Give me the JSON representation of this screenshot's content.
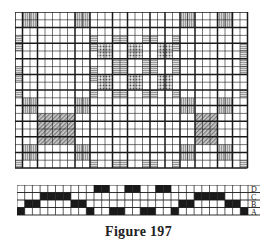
{
  "figure": {
    "caption": "Figure 197",
    "ink_color": "#1a1a1a",
    "shade_color": "#9a9a9a",
    "dot_color": "#555555"
  },
  "main_grid": {
    "cols": 31,
    "rows": 20,
    "cell_w": 7.5,
    "cell_h": 7.8,
    "thick_cols": [
      0,
      1,
      3,
      8,
      10,
      13,
      15,
      18,
      20,
      22,
      24,
      27,
      29,
      31
    ],
    "thick_rows": [
      0,
      2,
      4,
      6,
      8,
      10,
      12,
      14,
      16,
      18,
      20
    ],
    "shaded_blocks": [
      {
        "c": 1,
        "r": 0,
        "w": 2,
        "h": 2,
        "style": "vertical"
      },
      {
        "c": 8,
        "r": 0,
        "w": 2,
        "h": 2,
        "style": "vertical"
      },
      {
        "c": 22,
        "r": 0,
        "w": 2,
        "h": 2,
        "style": "vertical"
      },
      {
        "c": 27,
        "r": 0,
        "w": 2,
        "h": 2,
        "style": "vertical"
      },
      {
        "c": 0,
        "r": 3,
        "w": 1,
        "h": 2,
        "style": "horizontal"
      },
      {
        "c": 10,
        "r": 3,
        "w": 1,
        "h": 2,
        "style": "horizontal"
      },
      {
        "c": 13,
        "r": 3,
        "w": 2,
        "h": 1,
        "style": "horizontal"
      },
      {
        "c": 17,
        "r": 3,
        "w": 2,
        "h": 1,
        "style": "horizontal"
      },
      {
        "c": 21,
        "r": 3,
        "w": 1,
        "h": 2,
        "style": "horizontal"
      },
      {
        "c": 30,
        "r": 4,
        "w": 1,
        "h": 2,
        "style": "horizontal"
      },
      {
        "c": 11,
        "r": 4,
        "w": 2,
        "h": 2,
        "style": "dots"
      },
      {
        "c": 15,
        "r": 4,
        "w": 2,
        "h": 2,
        "style": "dots"
      },
      {
        "c": 19,
        "r": 4,
        "w": 2,
        "h": 2,
        "style": "dots"
      },
      {
        "c": 0,
        "r": 7,
        "w": 1,
        "h": 2,
        "style": "horizontal"
      },
      {
        "c": 10,
        "r": 7,
        "w": 1,
        "h": 2,
        "style": "horizontal"
      },
      {
        "c": 13,
        "r": 6,
        "w": 2,
        "h": 2,
        "style": "horizontal"
      },
      {
        "c": 17,
        "r": 6,
        "w": 2,
        "h": 2,
        "style": "horizontal"
      },
      {
        "c": 21,
        "r": 6,
        "w": 1,
        "h": 2,
        "style": "horizontal"
      },
      {
        "c": 30,
        "r": 6,
        "w": 1,
        "h": 2,
        "style": "horizontal"
      },
      {
        "c": 11,
        "r": 8,
        "w": 2,
        "h": 2,
        "style": "dots"
      },
      {
        "c": 15,
        "r": 8,
        "w": 2,
        "h": 2,
        "style": "dots"
      },
      {
        "c": 19,
        "r": 8,
        "w": 2,
        "h": 2,
        "style": "dots"
      },
      {
        "c": 0,
        "r": 10,
        "w": 1,
        "h": 1,
        "style": "horizontal"
      },
      {
        "c": 10,
        "r": 10,
        "w": 1,
        "h": 1,
        "style": "horizontal"
      },
      {
        "c": 13,
        "r": 10,
        "w": 2,
        "h": 1,
        "style": "horizontal"
      },
      {
        "c": 17,
        "r": 10,
        "w": 2,
        "h": 1,
        "style": "horizontal"
      },
      {
        "c": 21,
        "r": 10,
        "w": 1,
        "h": 1,
        "style": "horizontal"
      },
      {
        "c": 30,
        "r": 10,
        "w": 1,
        "h": 1,
        "style": "horizontal"
      },
      {
        "c": 1,
        "r": 11,
        "w": 2,
        "h": 2,
        "style": "vertical"
      },
      {
        "c": 8,
        "r": 11,
        "w": 2,
        "h": 2,
        "style": "vertical"
      },
      {
        "c": 22,
        "r": 11,
        "w": 2,
        "h": 2,
        "style": "vertical"
      },
      {
        "c": 27,
        "r": 11,
        "w": 2,
        "h": 2,
        "style": "vertical"
      },
      {
        "c": 3,
        "r": 13,
        "w": 5,
        "h": 4,
        "style": "diagonal"
      },
      {
        "c": 24,
        "r": 13,
        "w": 3,
        "h": 4,
        "style": "diagonal"
      },
      {
        "c": 1,
        "r": 17,
        "w": 2,
        "h": 2,
        "style": "vertical"
      },
      {
        "c": 8,
        "r": 17,
        "w": 2,
        "h": 2,
        "style": "vertical"
      },
      {
        "c": 22,
        "r": 17,
        "w": 2,
        "h": 2,
        "style": "vertical"
      },
      {
        "c": 27,
        "r": 17,
        "w": 2,
        "h": 2,
        "style": "vertical"
      },
      {
        "c": 0,
        "r": 19,
        "w": 1,
        "h": 1,
        "style": "horizontal"
      },
      {
        "c": 10,
        "r": 19,
        "w": 1,
        "h": 1,
        "style": "horizontal"
      },
      {
        "c": 13,
        "r": 19,
        "w": 2,
        "h": 1,
        "style": "horizontal"
      },
      {
        "c": 17,
        "r": 19,
        "w": 2,
        "h": 1,
        "style": "horizontal"
      },
      {
        "c": 21,
        "r": 19,
        "w": 1,
        "h": 1,
        "style": "horizontal"
      },
      {
        "c": 30,
        "r": 19,
        "w": 1,
        "h": 1,
        "style": "horizontal"
      }
    ]
  },
  "draft": {
    "cols": 30,
    "cell_w": 7.7,
    "cell_h": 7.5,
    "row_labels": [
      "D",
      "C",
      "B",
      "A"
    ],
    "rows": [
      {
        "label": "D",
        "filled": [
          10,
          11,
          14,
          15,
          18,
          19
        ]
      },
      {
        "label": "C",
        "filled": [
          3,
          4,
          5,
          6,
          23,
          24,
          25,
          26
        ]
      },
      {
        "label": "B",
        "filled": [
          1,
          2,
          7,
          8,
          21,
          22,
          27,
          28
        ]
      },
      {
        "label": "A",
        "filled": [
          0,
          9,
          12,
          13,
          16,
          17,
          20,
          29
        ]
      }
    ]
  }
}
